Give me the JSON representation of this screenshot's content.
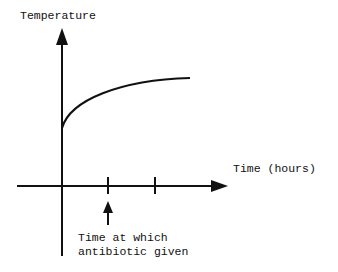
{
  "diagram": {
    "y_axis_label": "Temperature",
    "x_axis_label": "Time (hours)",
    "annotation_line1": "Time at which",
    "annotation_line2": "antibiotic given",
    "ticks_on_x_axis": 2,
    "curve_description": "Temperature rises steeply from the y-axis then levels off (concave increasing curve)",
    "colors": {
      "ink": "#111111",
      "background": "#ffffff"
    }
  }
}
